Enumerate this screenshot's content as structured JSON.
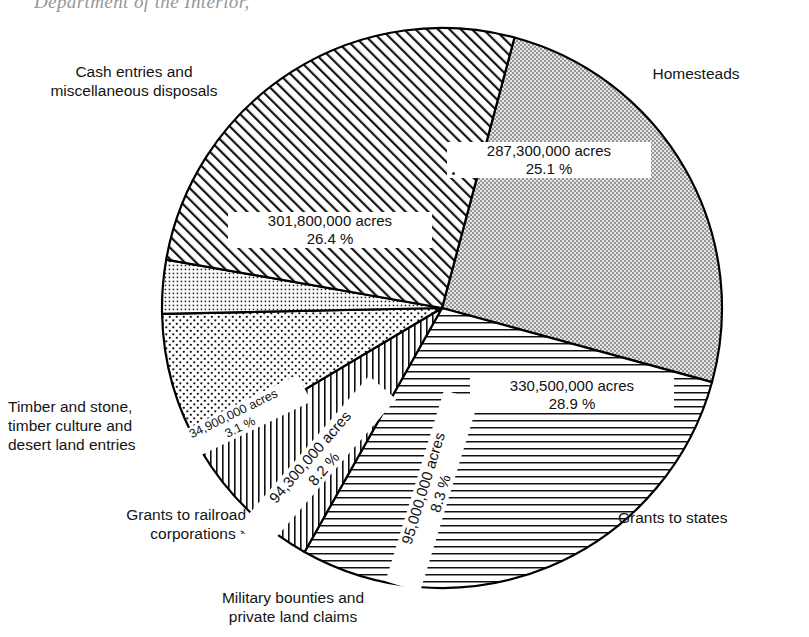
{
  "header": {
    "cut_off_caption": "Department of the Interior,"
  },
  "chart_data": {
    "type": "pie",
    "title": "",
    "unit": "acres",
    "center": {
      "x": 442,
      "y": 308
    },
    "radius": 280,
    "start_angle_deg": -75,
    "direction": "clockwise",
    "legend_position": "around-slices",
    "categories": [
      "Homesteads",
      "Grants to states",
      "Military bounties and\nprivate land claims",
      "Grants to railroad\ncorporations *",
      "Timber and stone,\ntimber culture and\ndesert land entries",
      "Cash entries and\nmiscellaneous disposals"
    ],
    "values": [
      287300000,
      330500000,
      95000000,
      94300000,
      34900000,
      301800000
    ],
    "percents": [
      25.1,
      28.9,
      8.3,
      8.2,
      3.1,
      26.4
    ],
    "value_labels": [
      "287,300,000 acres\n25.1 %",
      "330,500,000 acres\n28.9 %",
      "95,000,000 acres\n8.3 %",
      "94,300,000 acres\n8.2 %",
      "34,900,000 acres\n3.1 %",
      "301,800,000 acres\n26.4 %"
    ],
    "patterns": [
      "stipple-dense",
      "horizontal-lines",
      "vertical-lines",
      "dots-coarse",
      "grid-dots-fine",
      "diagonal-hatch"
    ],
    "colors": {
      "stroke": "#000000",
      "fill": "#ffffff",
      "ink": "#111111"
    }
  },
  "slices": [
    {
      "name": "homesteads",
      "label": "Homesteads",
      "value_text": "287,300,000 acres",
      "percent_text": "25.1 %",
      "value_label": "287,300,000 acres\n25.1 %"
    },
    {
      "name": "grants-to-states",
      "label": "Grants to states",
      "value_text": "330,500,000 acres",
      "percent_text": "28.9 %",
      "value_label": "330,500,000 acres\n28.9 %"
    },
    {
      "name": "military-bounties",
      "label": "Military bounties and\nprivate land claims",
      "value_text": "95,000,000 acres",
      "percent_text": "8.3 %",
      "value_label": "95,000,000 acres\n8.3 %"
    },
    {
      "name": "grants-to-railroad",
      "label": "Grants to railroad\ncorporations *",
      "value_text": "94,300,000 acres",
      "percent_text": "8.2 %",
      "value_label": "94,300,000 acres\n8.2 %"
    },
    {
      "name": "timber-and-stone",
      "label": "Timber and stone,\ntimber culture and\ndesert land entries",
      "value_text": "34,900,000 acres",
      "percent_text": "3.1 %",
      "value_label": "34,900,000 acres\n3.1 %"
    },
    {
      "name": "cash-entries",
      "label": "Cash entries and\nmiscellaneous disposals",
      "value_text": "301,800,000 acres",
      "percent_text": "26.4 %",
      "value_label": "301,800,000 acres\n26.4 %"
    }
  ]
}
